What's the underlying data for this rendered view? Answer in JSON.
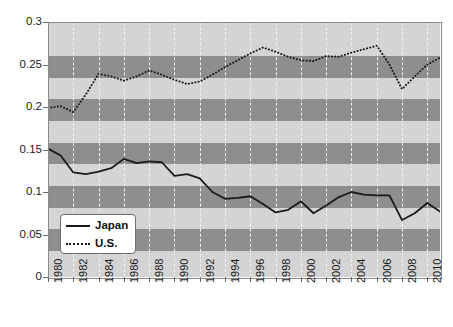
{
  "chart_data": {
    "type": "line",
    "title": "",
    "xlabel": "",
    "ylabel": "",
    "xlim": [
      1980,
      2011
    ],
    "ylim": [
      0,
      0.3
    ],
    "grid": true,
    "legend_position": "lower-left",
    "y_ticks": [
      "0",
      "0.05",
      "0.1",
      "0.15",
      "0.2",
      "0.25",
      "0.3"
    ],
    "y_tick_values": [
      0,
      0.05,
      0.1,
      0.15,
      0.2,
      0.25,
      0.3
    ],
    "x_ticks": [
      "1980",
      "1982",
      "1984",
      "1986",
      "1988",
      "1990",
      "1992",
      "1994",
      "1996",
      "1998",
      "2000",
      "2002",
      "2004",
      "2006",
      "2008",
      "2010"
    ],
    "x_tick_values": [
      1980,
      1982,
      1984,
      1986,
      1988,
      1990,
      1992,
      1994,
      1996,
      1998,
      2000,
      2002,
      2004,
      2006,
      2008,
      2010
    ],
    "x": [
      1980,
      1981,
      1982,
      1983,
      1984,
      1985,
      1986,
      1987,
      1988,
      1989,
      1990,
      1991,
      1992,
      1993,
      1994,
      1995,
      1996,
      1997,
      1998,
      1999,
      2000,
      2001,
      2002,
      2003,
      2004,
      2005,
      2006,
      2007,
      2008,
      2009,
      2010,
      2011
    ],
    "series": [
      {
        "name": "Japan",
        "style": "solid",
        "color": "#1a1a1a",
        "values": [
          0.151,
          0.143,
          0.123,
          0.121,
          0.124,
          0.128,
          0.139,
          0.134,
          0.136,
          0.135,
          0.119,
          0.121,
          0.116,
          0.1,
          0.092,
          0.093,
          0.095,
          0.086,
          0.076,
          0.079,
          0.089,
          0.075,
          0.084,
          0.094,
          0.1,
          0.097,
          0.096,
          0.096,
          0.067,
          0.075,
          0.087,
          0.077
        ]
      },
      {
        "name": "U.S.",
        "style": "dotted",
        "color": "#1a1a1a",
        "values": [
          0.199,
          0.201,
          0.194,
          0.215,
          0.239,
          0.236,
          0.231,
          0.236,
          0.243,
          0.238,
          0.232,
          0.227,
          0.23,
          0.238,
          0.247,
          0.255,
          0.263,
          0.27,
          0.265,
          0.259,
          0.255,
          0.254,
          0.26,
          0.259,
          0.264,
          0.268,
          0.272,
          0.25,
          0.221,
          0.236,
          0.25,
          0.258
        ]
      }
    ],
    "background_bands": {
      "base_color": "#d4d4d4",
      "alt_color": "#8e8e8e",
      "band_height_value": 0.0255,
      "bands": [
        [
          0.2345,
          0.26
        ],
        [
          0.1835,
          0.209
        ],
        [
          0.1325,
          0.158
        ],
        [
          0.0815,
          0.107
        ],
        [
          0.0305,
          0.056
        ]
      ]
    },
    "gridline_color": "#f2f2f2",
    "axis_color": "#8a8a8a"
  },
  "legend": {
    "entries": [
      {
        "label": "Japan",
        "style": "solid"
      },
      {
        "label": "U.S.",
        "style": "dotted"
      }
    ]
  }
}
